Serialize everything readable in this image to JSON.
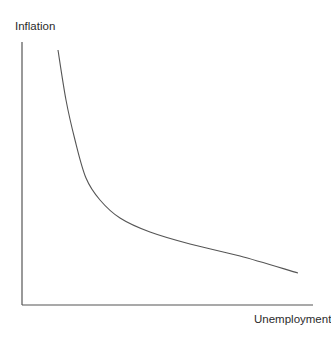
{
  "chart_data": {
    "type": "line",
    "title": "",
    "xlabel": "Unemployment",
    "ylabel": "Inflation",
    "grid": false,
    "legend": null,
    "ticks": {
      "x": [],
      "y": []
    },
    "series": [
      {
        "name": "Phillips curve",
        "color": "#555555",
        "points_px": [
          [
            58,
            50
          ],
          [
            66,
            100
          ],
          [
            75,
            140
          ],
          [
            86,
            178
          ],
          [
            100,
            200
          ],
          [
            120,
            218
          ],
          [
            150,
            232
          ],
          [
            190,
            244
          ],
          [
            240,
            256
          ],
          [
            298,
            273
          ]
        ]
      }
    ],
    "axes_px": {
      "origin": [
        22,
        305
      ],
      "y_top": 42,
      "x_right": 313
    }
  },
  "labels": {
    "y_axis": "Inflation",
    "x_axis": "Unemployment"
  },
  "colors": {
    "axis": "#555555",
    "curve": "#555555",
    "text": "#2b2b2b"
  }
}
